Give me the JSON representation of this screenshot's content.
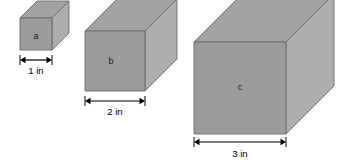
{
  "figure": {
    "title": "",
    "background_color": "#ffffff",
    "projection": "oblique",
    "colors": {
      "front_face": "#9b9b9b",
      "top_face": "#a2a2a2",
      "side_face": "#adadad",
      "outline": "#6b6b6b",
      "text": "#000000",
      "dimension_line": "#000000"
    },
    "boxes": [
      {
        "id": "box-a",
        "letter": "a",
        "dimension_label": "1 in",
        "units": 1,
        "front": {
          "x": 20,
          "y": 18,
          "w": 32,
          "h": 32
        },
        "depth": 17,
        "letter_pos": {
          "x": 36,
          "y": 37
        },
        "dim": {
          "x1": 20,
          "x2": 52,
          "y": 60,
          "label_x": 36,
          "label_y": 74
        }
      },
      {
        "id": "box-b",
        "letter": "b",
        "dimension_label": "2 in",
        "units": 2,
        "front": {
          "x": 85,
          "y": 31,
          "w": 60,
          "h": 60
        },
        "depth": 32,
        "letter_pos": {
          "x": 111,
          "y": 62
        },
        "dim": {
          "x1": 85,
          "x2": 145,
          "y": 101,
          "label_x": 115,
          "label_y": 115
        }
      },
      {
        "id": "box-c",
        "letter": "c",
        "dimension_label": "3 in",
        "units": 3,
        "front": {
          "x": 194,
          "y": 42,
          "w": 92,
          "h": 92
        },
        "depth": 48,
        "letter_pos": {
          "x": 240,
          "y": 88
        },
        "dim": {
          "x1": 194,
          "x2": 286,
          "y": 142,
          "label_x": 240,
          "label_y": 157
        }
      }
    ]
  }
}
